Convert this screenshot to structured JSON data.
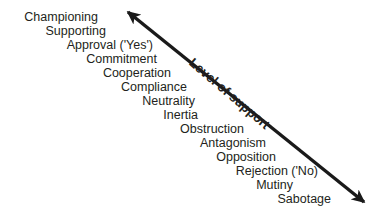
{
  "diagram": {
    "title": "Level of support",
    "axis": {
      "label": "Level of support",
      "type": "double-headed-arrow",
      "direction": "upper-left to lower-right",
      "start": {
        "x": 128,
        "y": 12
      },
      "end": {
        "x": 364,
        "y": 202
      },
      "color": "#1a1a1a",
      "line_width": 3.4,
      "head_start": "arrow",
      "head_end": "arrow"
    },
    "text_color": "#231f20",
    "background_color": "#ffffff",
    "scale": {
      "top_meaning": "highest support",
      "bottom_meaning": "lowest support",
      "items": [
        {
          "rank": 1,
          "label": "Championing",
          "right": 98,
          "top": 10
        },
        {
          "rank": 2,
          "label": "Supporting",
          "right": 106,
          "top": 24
        },
        {
          "rank": 3,
          "label": "Approval ('Yes')",
          "right": 153,
          "top": 38
        },
        {
          "rank": 4,
          "label": "Commitment",
          "right": 157,
          "top": 52
        },
        {
          "rank": 5,
          "label": "Cooperation",
          "right": 171,
          "top": 66
        },
        {
          "rank": 6,
          "label": "Compliance",
          "right": 187,
          "top": 80
        },
        {
          "rank": 7,
          "label": "Neutrality",
          "right": 195,
          "top": 94
        },
        {
          "rank": 8,
          "label": "Inertia",
          "right": 198,
          "top": 108
        },
        {
          "rank": 9,
          "label": "Obstruction",
          "right": 244,
          "top": 122
        },
        {
          "rank": 10,
          "label": "Antagonism",
          "right": 266,
          "top": 136
        },
        {
          "rank": 11,
          "label": "Opposition",
          "right": 276,
          "top": 150
        },
        {
          "rank": 12,
          "label": "Rejection ('No)",
          "right": 318,
          "top": 164
        },
        {
          "rank": 13,
          "label": "Mutiny",
          "right": 293,
          "top": 178
        },
        {
          "rank": 14,
          "label": "Sabotage",
          "right": 331,
          "top": 192
        }
      ]
    }
  }
}
